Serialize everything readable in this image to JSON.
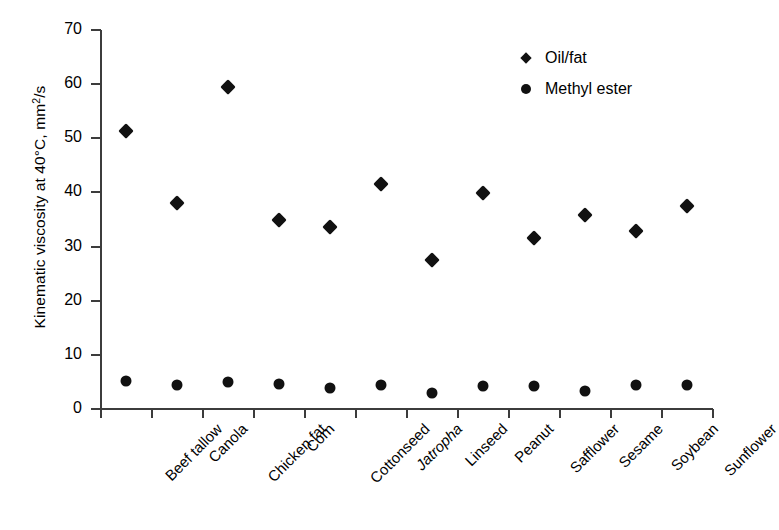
{
  "chart_data": {
    "type": "scatter",
    "title": "",
    "xlabel": "",
    "ylabel": "Kinematic viscosity at 40°C, mm2/s",
    "ylabel_parts": {
      "before": "Kinematic viscosity at 40°C, mm",
      "sup": "2",
      "after": "/s"
    },
    "ylim": [
      0,
      70
    ],
    "ytick_step": 10,
    "yticks": [
      0,
      10,
      20,
      30,
      40,
      50,
      60,
      70
    ],
    "ytick_labels": [
      "0",
      "10",
      "20",
      "30",
      "40",
      "50",
      "60",
      "70"
    ],
    "grid": false,
    "legend_position": "top-right",
    "categories": [
      "Beef tallow",
      "Canola",
      "Chicken fat",
      "Corn",
      "Cottonseed",
      "Jatropha",
      "Linseed",
      "Peanut",
      "Safflower",
      "Sesame",
      "Soybean",
      "Sunflower"
    ],
    "categories_italic": [
      false,
      false,
      false,
      false,
      false,
      true,
      false,
      false,
      false,
      false,
      false,
      false
    ],
    "series": [
      {
        "name": "Oil/fat",
        "marker": "diamond",
        "color": "#111111",
        "values": [
          51.3,
          38.1,
          59.4,
          35.0,
          33.7,
          41.6,
          27.5,
          39.9,
          31.6,
          35.8,
          32.9,
          37.5
        ]
      },
      {
        "name": "Methyl ester",
        "marker": "circle",
        "color": "#111111",
        "values": [
          5.1,
          4.4,
          5.0,
          4.6,
          3.8,
          4.4,
          3.0,
          4.2,
          4.3,
          3.3,
          4.4,
          4.4
        ]
      }
    ]
  },
  "legend": {
    "items": [
      {
        "label": "Oil/fat",
        "marker": "diamond"
      },
      {
        "label": "Methyl ester",
        "marker": "circle"
      }
    ]
  }
}
